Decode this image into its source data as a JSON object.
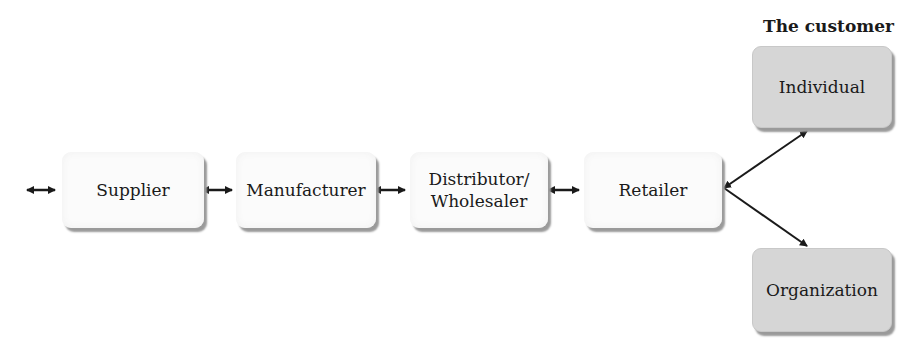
{
  "diagram": {
    "customer_title": "The customer",
    "chain": [
      {
        "label": "Supplier"
      },
      {
        "label": "Manufacturer"
      },
      {
        "label": "Distributor/\nWholesaler",
        "line1": "Distributor/",
        "line2": "Wholesaler"
      },
      {
        "label": "Retailer"
      }
    ],
    "customers": [
      {
        "label": "Individual"
      },
      {
        "label": "Organization"
      }
    ],
    "connectors": "double-headed arrows between chain stages; retailer branches to Individual and Organization",
    "colors": {
      "chain_box": "#fbfbfb",
      "customer_box": "#d6d6d6",
      "arrow": "#1a1a1a",
      "shadow": "#9a9a9a"
    }
  }
}
